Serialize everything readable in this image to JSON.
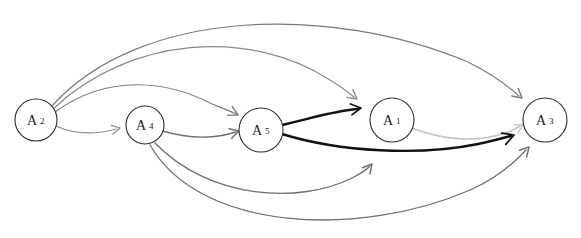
{
  "figure": {
    "title": "",
    "type": "directed-graph",
    "width": 581,
    "height": 238,
    "background": "#ffffff"
  },
  "palette": {
    "node_stroke": "#2b2b2b",
    "node_fill": "#ffffff",
    "label_color": "#1a1a1a",
    "edge_gray": "#6e6e6e",
    "edge_gray_light": "#9a9a9a",
    "edge_gray_pale": "#c3c3c3",
    "edge_black": "#111111"
  },
  "nodes": [
    {
      "id": "A2",
      "label": "A",
      "sub": "2",
      "cx": 36,
      "cy": 120,
      "r": 21
    },
    {
      "id": "A4",
      "label": "A",
      "sub": "4",
      "cx": 145,
      "cy": 125,
      "r": 19
    },
    {
      "id": "A5",
      "label": "A",
      "sub": "5",
      "cx": 261,
      "cy": 130,
      "r": 22
    },
    {
      "id": "A1",
      "label": "A",
      "sub": "1",
      "cx": 392,
      "cy": 120,
      "r": 22
    },
    {
      "id": "A3",
      "label": "A",
      "sub": "3",
      "cx": 545,
      "cy": 120,
      "r": 22
    }
  ],
  "edges": [
    {
      "id": "e-a2-a3-top",
      "from": "A2",
      "to": "A3",
      "color": "#7a7a7a",
      "width": 1.2,
      "style": "arc-above-far",
      "path": "M 52 106 C 140 8, 330 4, 468 62 C 492 74, 508 86, 519 96"
    },
    {
      "id": "e-a2-a1-upper",
      "from": "A2",
      "to": "A1",
      "color": "#8a8a8a",
      "width": 1.2,
      "style": "arc-above-mid",
      "path": "M 53 109 C 130 36, 250 28, 330 80 C 340 86, 348 92, 354 97"
    },
    {
      "id": "e-a2-a5-low",
      "from": "A2",
      "to": "A5",
      "color": "#7d7d7d",
      "width": 1.2,
      "style": "arc-above-near",
      "path": "M 55 112 C 110 72, 170 82, 212 104 C 222 108, 230 111, 236 114"
    },
    {
      "id": "e-a2-a4",
      "from": "A2",
      "to": "A4",
      "color": "#8d8d8d",
      "width": 1.2,
      "style": "arc-short",
      "path": "M 56 126 C 78 136, 98 134, 116 129"
    },
    {
      "id": "e-a4-a5",
      "from": "A4",
      "to": "A5",
      "color": "#6e6e6e",
      "width": 1.4,
      "style": "arc-short",
      "path": "M 163 131 C 192 140, 218 138, 236 132"
    },
    {
      "id": "e-a4-a1-lower",
      "from": "A4",
      "to": "A1",
      "color": "#6e6e6e",
      "width": 1.3,
      "style": "arc-below",
      "path": "M 155 143 C 210 200, 300 204, 352 178 C 360 174, 366 170, 370 166"
    },
    {
      "id": "e-a4-a3-lower",
      "from": "A4",
      "to": "A3",
      "color": "#6e6e6e",
      "width": 1.3,
      "style": "arc-below-far",
      "path": "M 150 145 C 200 232, 360 238, 470 190 C 495 179, 515 162, 526 150"
    },
    {
      "id": "e-a5-a1-bold",
      "from": "A5",
      "to": "A1",
      "color": "#111111",
      "width": 2.4,
      "style": "arc-bold",
      "path": "M 282 125 C 312 118, 338 110, 358 109"
    },
    {
      "id": "e-a5-a3-bold",
      "from": "A5",
      "to": "A3",
      "color": "#111111",
      "width": 2.4,
      "style": "arc-bold-far",
      "path": "M 282 134 C 340 152, 420 156, 478 144 C 492 141, 503 138, 511 136"
    },
    {
      "id": "e-a1-a3-pale",
      "from": "A1",
      "to": "A3",
      "color": "#c3c3c3",
      "width": 1.6,
      "style": "arc-pale",
      "path": "M 412 128 C 448 142, 482 142, 508 132 C 513 130, 517 128, 520 126"
    }
  ],
  "arrowheads": [
    {
      "id": "ah-a2-a3-top",
      "x": 522,
      "y": 98,
      "angle": 40,
      "color": "#7a7a7a",
      "size": 9
    },
    {
      "id": "ah-a2-a1-upper",
      "x": 357,
      "y": 99,
      "angle": 38,
      "color": "#8a8a8a",
      "size": 9
    },
    {
      "id": "ah-a2-a5-low",
      "x": 238,
      "y": 115,
      "angle": 27,
      "color": "#7d7d7d",
      "size": 9
    },
    {
      "id": "ah-a2-a4",
      "x": 120,
      "y": 128,
      "angle": -12,
      "color": "#8d8d8d",
      "size": 8
    },
    {
      "id": "ah-a4-a5",
      "x": 239,
      "y": 131,
      "angle": -16,
      "color": "#6e6e6e",
      "size": 9
    },
    {
      "id": "ah-a4-a1",
      "x": 372,
      "y": 164,
      "angle": -50,
      "color": "#6e6e6e",
      "size": 9
    },
    {
      "id": "ah-a4-a3",
      "x": 529,
      "y": 147,
      "angle": -48,
      "color": "#6e6e6e",
      "size": 9
    },
    {
      "id": "ah-a5-a1",
      "x": 361,
      "y": 108,
      "angle": -8,
      "color": "#111111",
      "size": 10
    },
    {
      "id": "ah-a5-a3",
      "x": 514,
      "y": 135,
      "angle": -20,
      "color": "#111111",
      "size": 11
    },
    {
      "id": "ah-a1-a3",
      "x": 523,
      "y": 125,
      "angle": -28,
      "color": "#c3c3c3",
      "size": 8
    }
  ]
}
